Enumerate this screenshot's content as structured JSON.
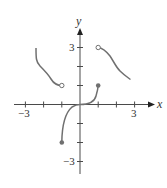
{
  "figure": {
    "type": "piecewise function graph",
    "axes": {
      "x_label": "x",
      "y_label": "y",
      "x_range": [
        -3,
        3
      ],
      "y_range": [
        -3,
        3
      ],
      "x_tick_values": [
        -3,
        -2,
        -1,
        1,
        2,
        3
      ],
      "y_tick_values": [
        -3,
        -2,
        -1,
        1,
        2,
        3
      ],
      "x_tick_labels": [
        "−3",
        "3"
      ],
      "y_tick_labels": [
        "3",
        "−3"
      ]
    },
    "colors": {
      "axis": "#4a4a4a",
      "curve": "#707070",
      "background": "#ffffff"
    },
    "pieces": [
      {
        "name": "left-piece",
        "start": [
          -2.4,
          3
        ],
        "end": [
          -1,
          1
        ],
        "end_marker": "open"
      },
      {
        "name": "middle-piece",
        "start": [
          -1,
          -2
        ],
        "through": [
          0,
          0
        ],
        "end": [
          1,
          1
        ],
        "start_marker": "closed",
        "end_marker": "closed"
      },
      {
        "name": "right-piece",
        "start": [
          1,
          3
        ],
        "end": [
          2.8,
          1.3
        ],
        "start_marker": "open"
      }
    ]
  }
}
